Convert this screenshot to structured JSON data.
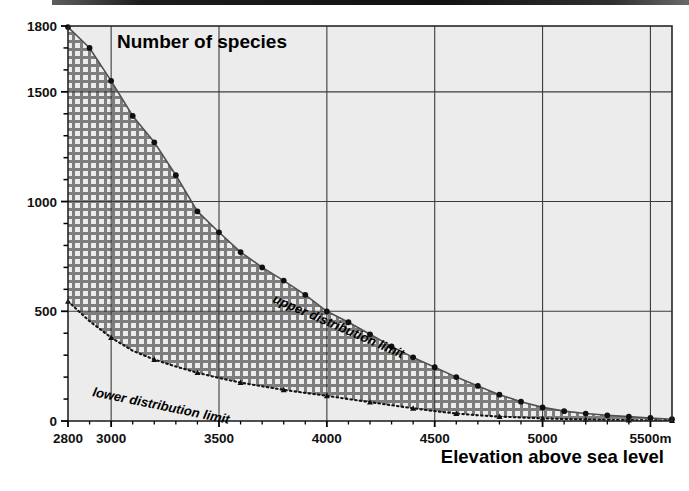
{
  "chart_data": {
    "type": "area",
    "title": "Number of species",
    "xlabel": "Elevation above sea level",
    "ylabel": "Number of species",
    "xlim": [
      2800,
      5600
    ],
    "ylim": [
      0,
      1800
    ],
    "grid": true,
    "legend_position": "inline-annotations",
    "x_ticks": [
      {
        "value": 2800,
        "label": "2800"
      },
      {
        "value": 3000,
        "label": "3000"
      },
      {
        "value": 3500,
        "label": "3500"
      },
      {
        "value": 4000,
        "label": "4000"
      },
      {
        "value": 4500,
        "label": "4500"
      },
      {
        "value": 5000,
        "label": "5000"
      },
      {
        "value": 5500,
        "label": "5500m"
      }
    ],
    "x_gridlines": [
      3000,
      3500,
      4000,
      4500,
      5000,
      5500
    ],
    "x_minor_ticks": [
      2900,
      3100,
      3200,
      3300,
      3400,
      3600,
      3700,
      3800,
      3900,
      4100,
      4200,
      4300,
      4400,
      4600,
      4700,
      4800,
      4900,
      5100,
      5200,
      5300,
      5400
    ],
    "y_ticks": [
      {
        "value": 0,
        "label": "0"
      },
      {
        "value": 500,
        "label": "500"
      },
      {
        "value": 1000,
        "label": "1000"
      },
      {
        "value": 1500,
        "label": "1500"
      },
      {
        "value": 1800,
        "label": "1800"
      }
    ],
    "y_gridlines": [
      500,
      1000,
      1500
    ],
    "y_minor_ticks": [
      100,
      200,
      300,
      400,
      600,
      700,
      800,
      900,
      1100,
      1200,
      1300,
      1400,
      1600,
      1700
    ],
    "series": [
      {
        "name": "upper distribution limit",
        "label": "upper distribution limit",
        "marker": "filled-circle",
        "line_style": "solid",
        "x": [
          2800,
          2900,
          3000,
          3100,
          3200,
          3300,
          3400,
          3500,
          3600,
          3700,
          3800,
          3900,
          4000,
          4100,
          4200,
          4300,
          4400,
          4500,
          4600,
          4700,
          4800,
          4900,
          5000,
          5100,
          5200,
          5300,
          5400,
          5500,
          5600
        ],
        "values": [
          1795,
          1700,
          1550,
          1390,
          1270,
          1120,
          955,
          860,
          770,
          700,
          640,
          575,
          500,
          450,
          395,
          340,
          290,
          245,
          200,
          160,
          120,
          88,
          62,
          45,
          34,
          26,
          20,
          14,
          8
        ]
      },
      {
        "name": "lower distribution limit",
        "label": "lower distribution limit",
        "marker": "filled-triangle",
        "line_style": "dotted",
        "x": [
          2800,
          2900,
          3000,
          3100,
          3200,
          3300,
          3400,
          3500,
          3600,
          3700,
          3800,
          3900,
          4000,
          4100,
          4200,
          4300,
          4400,
          4500,
          4600,
          4700,
          4800,
          4900,
          5000,
          5100,
          5200,
          5300,
          5400,
          5500,
          5600
        ],
        "values": [
          545,
          455,
          380,
          320,
          280,
          248,
          220,
          196,
          175,
          158,
          142,
          128,
          115,
          100,
          86,
          72,
          58,
          45,
          34,
          26,
          20,
          16,
          12,
          9,
          7,
          5,
          4,
          3,
          2
        ]
      }
    ],
    "annotations": [
      {
        "name": "upper-curve-label",
        "text": "upper distribution limit"
      },
      {
        "name": "lower-curve-label",
        "text": "lower distribution limit"
      }
    ],
    "colors": {
      "plot_background": "#ececec",
      "hatch_fill": "#787878",
      "grid": "#3c3c3c",
      "axis": "#000000",
      "marker": "#101010",
      "upper_line": "#4a4a4a",
      "text": "#000000"
    }
  }
}
